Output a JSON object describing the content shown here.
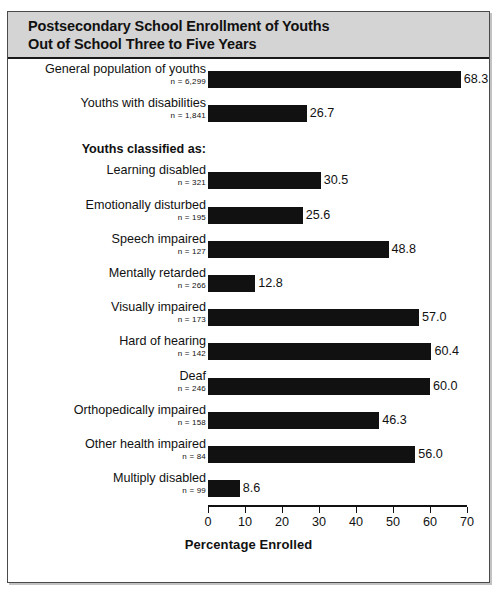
{
  "figure": {
    "title_line_1": "Postsecondary School Enrollment of Youths",
    "title_line_2": "Out of School Three to Five Years",
    "group_header": "Youths classified as:"
  },
  "chart_data": {
    "type": "bar",
    "orientation": "horizontal",
    "title": "Postsecondary School Enrollment of Youths Out of School Three to Five Years",
    "xlabel": "Percentage Enrolled",
    "ylabel": "",
    "xlim": [
      0,
      70
    ],
    "xticks": [
      "0",
      "10",
      "20",
      "30",
      "40",
      "50",
      "60",
      "70"
    ],
    "grid": false,
    "legend": null,
    "bar_color": "#111111",
    "categories": [
      "General population of youths",
      "Youths with disabilities",
      "Learning disabled",
      "Emotionally disturbed",
      "Speech impaired",
      "Mentally retarded",
      "Visually impaired",
      "Hard of hearing",
      "Deaf",
      "Orthopedically impaired",
      "Other health impaired",
      "Multiply disabled"
    ],
    "values": [
      68.3,
      26.7,
      30.5,
      25.6,
      48.8,
      12.8,
      57.0,
      60.4,
      60.0,
      46.3,
      56.0,
      8.6
    ],
    "value_labels": [
      "68.3",
      "26.7",
      "30.5",
      "25.6",
      "48.8",
      "12.8",
      "57.0",
      "60.4",
      "60.0",
      "46.3",
      "56.0",
      "8.6"
    ],
    "sample_sizes": [
      "n = 6,299",
      "n = 1,841",
      "n = 321",
      "n = 195",
      "n = 127",
      "n = 266",
      "n = 173",
      "n = 142",
      "n = 246",
      "n = 158",
      "n = 84",
      "n = 99"
    ],
    "group_header": "Youths classified as:",
    "group_header_after_index": 1
  }
}
